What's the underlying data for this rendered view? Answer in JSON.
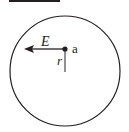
{
  "diagram": {
    "field_label": "E",
    "point_label": "a",
    "radius_label": "r",
    "stroke_color": "#231f20",
    "background": "#ffffff"
  }
}
